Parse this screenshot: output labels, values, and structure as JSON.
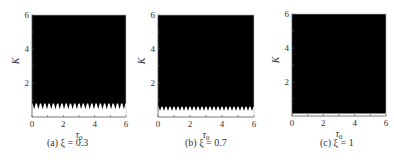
{
  "chart_data": [
    {
      "type": "area",
      "title": "(a) ξ = 0.3",
      "caption": "(a) ξ = 0.3",
      "xlabel": "τ0",
      "ylabel": "K",
      "xlim": [
        0,
        6
      ],
      "ylim": [
        0,
        6
      ],
      "xticks": [
        0,
        2,
        4,
        6
      ],
      "yticks": [
        2,
        4,
        6
      ],
      "fill_color": "#000000",
      "description": "Black region = stable/filled area above a boundary curve; boundary oscillates with tau0",
      "boundary": {
        "base_K": 0.8,
        "tooth_min_K": 0.45,
        "teeth_count": 22
      }
    },
    {
      "type": "area",
      "title": "(b) ξ = 0.7",
      "caption": "(b) ξ = 0.7",
      "xlabel": "τ0",
      "ylabel": "K",
      "xlim": [
        0,
        6
      ],
      "ylim": [
        0,
        6
      ],
      "xticks": [
        0,
        2,
        4,
        6
      ],
      "yticks": [
        2,
        4,
        6
      ],
      "fill_color": "#000000",
      "boundary": {
        "base_K": 0.6,
        "tooth_min_K": 0.35,
        "teeth_count": 24
      }
    },
    {
      "type": "area",
      "title": "(c) ξ = 1",
      "caption": "(c) ξ = 1",
      "xlabel": "τ0",
      "ylabel": "K",
      "xlim": [
        0,
        6
      ],
      "ylim": [
        0,
        6
      ],
      "xticks": [
        0,
        2,
        4,
        6
      ],
      "yticks": [
        2,
        4,
        6
      ],
      "fill_color": "#000000",
      "boundary": {
        "base_K": 0.15,
        "tooth_min_K": 0.15,
        "teeth_count": 0
      }
    }
  ],
  "panels": [
    {
      "caption": "(a) ξ = 0.3",
      "xlabel": "τ",
      "xsub": "0",
      "ylabel": "K",
      "xtick_labels": [
        "0",
        "2",
        "4",
        "6"
      ],
      "ytick_labels": [
        "2",
        "4",
        "6"
      ]
    },
    {
      "caption": "(b) ξ = 0.7",
      "xlabel": "τ",
      "xsub": "0",
      "ylabel": "K",
      "xtick_labels": [
        "0",
        "2",
        "4",
        "6"
      ],
      "ytick_labels": [
        "2",
        "4",
        "6"
      ]
    },
    {
      "caption": "(c) ξ = 1",
      "xlabel": "τ",
      "xsub": "0",
      "ylabel": "K",
      "xtick_labels": [
        "0",
        "2",
        "4",
        "6"
      ],
      "ytick_labels": [
        "2",
        "4",
        "6"
      ]
    }
  ]
}
